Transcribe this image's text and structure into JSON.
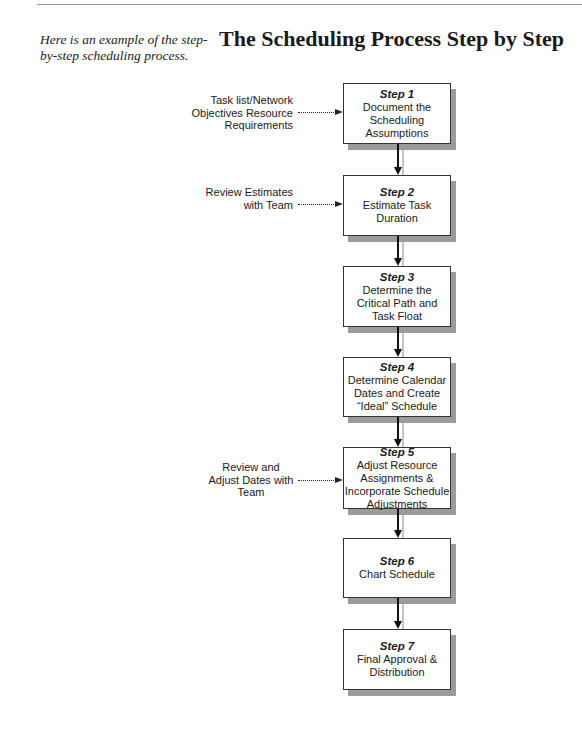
{
  "header": {
    "caption": "Here is an example of the step-by-step scheduling process.",
    "title": "The Scheduling Process Step by Step"
  },
  "steps": [
    {
      "number": "Step 1",
      "text": "Document the Scheduling Assumptions"
    },
    {
      "number": "Step 2",
      "text": "Estimate Task Duration"
    },
    {
      "number": "Step 3",
      "text": "Determine the Critical Path and Task Float"
    },
    {
      "number": "Step 4",
      "text": "Determine Calendar Dates and Create “Ideal” Schedule"
    },
    {
      "number": "Step 5",
      "text": "Adjust Resource Assignments & Incorporate Schedule Adjustments"
    },
    {
      "number": "Step 6",
      "text": "Chart Schedule"
    },
    {
      "number": "Step 7",
      "text": "Final Approval & Distribution"
    }
  ],
  "inputs": [
    {
      "target_step": "Step 1",
      "text": "Task list/Network Objectives Resource Requirements"
    },
    {
      "target_step": "Step 2",
      "text": "Review Estimates with Team"
    },
    {
      "target_step": "Step 5",
      "text": "Review and Adjust Dates with Team"
    }
  ]
}
